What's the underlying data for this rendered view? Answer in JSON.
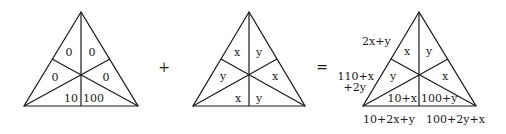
{
  "diagram": {
    "triangle_1": {
      "regions": {
        "top_left": "0",
        "top_right": "0",
        "mid_left": "0",
        "mid_right": "0",
        "bottom_left": "10",
        "bottom_right": "100"
      }
    },
    "operator_plus": "+",
    "triangle_2": {
      "regions": {
        "top_left": "x",
        "top_right": "y",
        "mid_left": "y",
        "mid_right": "x",
        "bottom_left": "x",
        "bottom_right": "y"
      }
    },
    "operator_equals": "=",
    "triangle_3": {
      "regions": {
        "top_left": "x",
        "top_right": "y",
        "mid_left": "y",
        "mid_right": "x",
        "bottom_left": "10+x",
        "bottom_right": "100+y"
      },
      "side_sums": {
        "left_upper": "2x+y",
        "left_lower_line1": "110+x",
        "left_lower_line2": "+2y",
        "bottom_left": "10+2x+y",
        "bottom_right": "100+2y+x"
      }
    }
  }
}
